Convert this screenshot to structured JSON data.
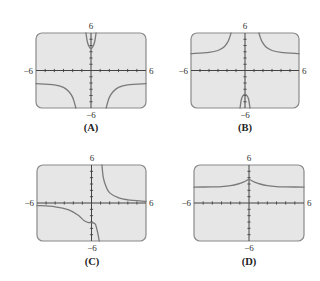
{
  "chart_data": [
    {
      "type": "line",
      "label": "(A)",
      "xlim": [
        -6,
        6
      ],
      "ylim": [
        -6,
        6
      ],
      "x_tick_labels": [
        "-6",
        "6"
      ],
      "y_tick_labels": [
        "6",
        "-6"
      ],
      "grid": false,
      "description": "Two vertical asymptotes near x=-1.5 and x=1.5; central branch opens upward with minimum about 3.5 at x=0; outer branches approach y=-2 from below",
      "series": [
        {
          "name": "left-branch",
          "x": [
            -6,
            -4,
            -3,
            -2.4,
            -2,
            -1.8,
            -1.65
          ],
          "y": [
            -2.1,
            -2.3,
            -2.7,
            -3.4,
            -4.3,
            -5.2,
            -6
          ]
        },
        {
          "name": "center-branch",
          "x": [
            -0.55,
            -0.4,
            -0.2,
            0,
            0.2,
            0.4,
            0.55
          ],
          "y": [
            6,
            4.6,
            3.8,
            3.5,
            3.8,
            4.6,
            6
          ]
        },
        {
          "name": "right-branch",
          "x": [
            1.65,
            1.8,
            2,
            2.4,
            3,
            4,
            6
          ],
          "y": [
            -6,
            -5.2,
            -4.3,
            -3.4,
            -2.7,
            -2.3,
            -2.1
          ]
        }
      ]
    },
    {
      "type": "line",
      "label": "(B)",
      "xlim": [
        -6,
        6
      ],
      "ylim": [
        -6,
        6
      ],
      "x_tick_labels": [
        "-6",
        "6"
      ],
      "y_tick_labels": [
        "6",
        "-6"
      ],
      "grid": false,
      "description": "Two vertical asymptotes near x=-1.5 and x=1.5; outer branches approach y=2.7 from above; central branch opens downward with maximum about -3.8 at x=0",
      "series": [
        {
          "name": "left-branch",
          "x": [
            -6,
            -4,
            -3,
            -2.3,
            -1.9,
            -1.7,
            -1.55
          ],
          "y": [
            2.7,
            2.9,
            3.2,
            3.8,
            4.6,
            5.3,
            6
          ]
        },
        {
          "name": "center-branch",
          "x": [
            -0.55,
            -0.4,
            -0.2,
            0,
            0.2,
            0.4,
            0.55
          ],
          "y": [
            -6,
            -4.6,
            -4.0,
            -3.8,
            -4.0,
            -4.6,
            -6
          ]
        },
        {
          "name": "right-branch",
          "x": [
            1.55,
            1.7,
            1.9,
            2.3,
            3,
            4,
            6
          ],
          "y": [
            6,
            5.3,
            4.6,
            3.8,
            3.2,
            2.9,
            2.7
          ]
        }
      ]
    },
    {
      "type": "line",
      "label": "(C)",
      "xlim": [
        -6,
        6
      ],
      "ylim": [
        -6,
        6
      ],
      "x_tick_labels": [
        "-6",
        "6"
      ],
      "y_tick_labels": [
        "6",
        "-6"
      ],
      "grid": false,
      "description": "Vertical asymptote near x=1; right branch decays from +inf toward y=0.2; left branch descends from y=-0.4 with a shelf near y=-3 at x=0 then drops to -inf",
      "series": [
        {
          "name": "left-branch",
          "x": [
            -6,
            -4,
            -2.5,
            -1.5,
            -0.8,
            -0.3,
            0,
            0.4,
            0.6,
            0.75,
            0.85
          ],
          "y": [
            -0.4,
            -0.6,
            -1.1,
            -1.9,
            -2.8,
            -3.1,
            -3.1,
            -3.3,
            -4.2,
            -5.2,
            -6
          ]
        },
        {
          "name": "right-branch",
          "x": [
            1.15,
            1.3,
            1.6,
            2,
            3,
            4,
            6
          ],
          "y": [
            6,
            4.0,
            2.6,
            1.6,
            0.8,
            0.5,
            0.25
          ]
        }
      ]
    },
    {
      "type": "line",
      "label": "(D)",
      "xlim": [
        -6,
        6
      ],
      "ylim": [
        -6,
        6
      ],
      "x_tick_labels": [
        "-6",
        "6"
      ],
      "y_tick_labels": [
        "6",
        "-6"
      ],
      "grid": false,
      "description": "Continuous curve with horizontal asymptote y=2.5 and a cusp-like peak about 3.7 at x=0",
      "series": [
        {
          "name": "curve",
          "x": [
            -6,
            -4,
            -3,
            -2,
            -1.2,
            -0.6,
            -0.2,
            0,
            0.2,
            0.6,
            1.2,
            2,
            3,
            4,
            6
          ],
          "y": [
            2.5,
            2.55,
            2.6,
            2.75,
            3.0,
            3.3,
            3.6,
            3.75,
            3.6,
            3.3,
            3.0,
            2.75,
            2.6,
            2.55,
            2.5
          ]
        }
      ]
    }
  ],
  "panels": [
    {
      "caption": "(A)",
      "xmin_label": "−6",
      "xmax_label": "6",
      "ymax_label": "6",
      "ymin_label": "−6"
    },
    {
      "caption": "(B)",
      "xmin_label": "−6",
      "xmax_label": "6",
      "ymax_label": "6",
      "ymin_label": "−6"
    },
    {
      "caption": "(C)",
      "xmin_label": "−6",
      "xmax_label": "6",
      "ymax_label": "6",
      "ymin_label": "−6"
    },
    {
      "caption": "(D)",
      "xmin_label": "−6",
      "xmax_label": "6",
      "ymax_label": "6",
      "ymin_label": "−6"
    }
  ]
}
